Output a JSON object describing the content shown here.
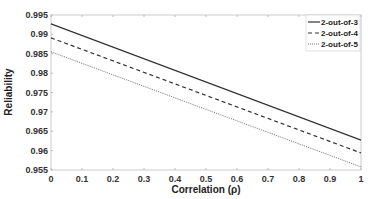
{
  "chart_data": {
    "type": "line",
    "title": "",
    "xlabel": "Correlation (ρ)",
    "ylabel": "Reliability",
    "xlim": [
      0,
      1
    ],
    "ylim": [
      0.955,
      0.995
    ],
    "xticks": [
      "0",
      "0.1",
      "0.2",
      "0.3",
      "0.4",
      "0.5",
      "0.6",
      "0.7",
      "0.8",
      "0.9",
      "1"
    ],
    "yticks": [
      "0.995",
      "0.99",
      "0.985",
      "0.98",
      "0.975",
      "0.97",
      "0.965",
      "0.96",
      "0.955"
    ],
    "grid": false,
    "legend_position": "upper right",
    "x": [
      0,
      1
    ],
    "series": [
      {
        "name": "2-out-of-3",
        "style": "solid",
        "values": [
          0.9927,
          0.9627
        ]
      },
      {
        "name": "2-out-of-4",
        "style": "dashed",
        "values": [
          0.9891,
          0.9594
        ]
      },
      {
        "name": "2-out-of-5",
        "style": "dotted",
        "values": [
          0.9855,
          0.9558
        ]
      }
    ]
  }
}
